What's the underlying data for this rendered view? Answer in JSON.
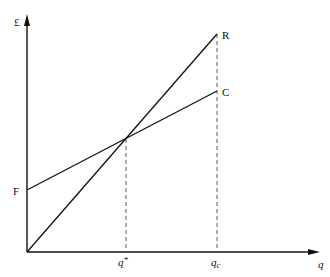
{
  "diagram": {
    "type": "break-even chart",
    "y_axis_label": "£",
    "x_axis_label": "q",
    "lines": [
      {
        "name": "revenue",
        "label": "R",
        "from": [
          0,
          0
        ],
        "description": "Total revenue line from origin"
      },
      {
        "name": "cost",
        "label": "C",
        "from": [
          0,
          "F"
        ],
        "description": "Total cost line with fixed cost intercept F"
      }
    ],
    "intercept_label": "F",
    "x_markers": [
      {
        "label": "q*",
        "description": "break-even output where R = C"
      },
      {
        "label": "q",
        "sub": "c",
        "description": "capacity output"
      }
    ]
  },
  "labels": {
    "pound": "£",
    "q": "q",
    "R": "R",
    "C": "C",
    "F": "F",
    "qstar_base": "q",
    "qstar_sup": "*",
    "qc_base": "q",
    "qc_sub": "c"
  }
}
